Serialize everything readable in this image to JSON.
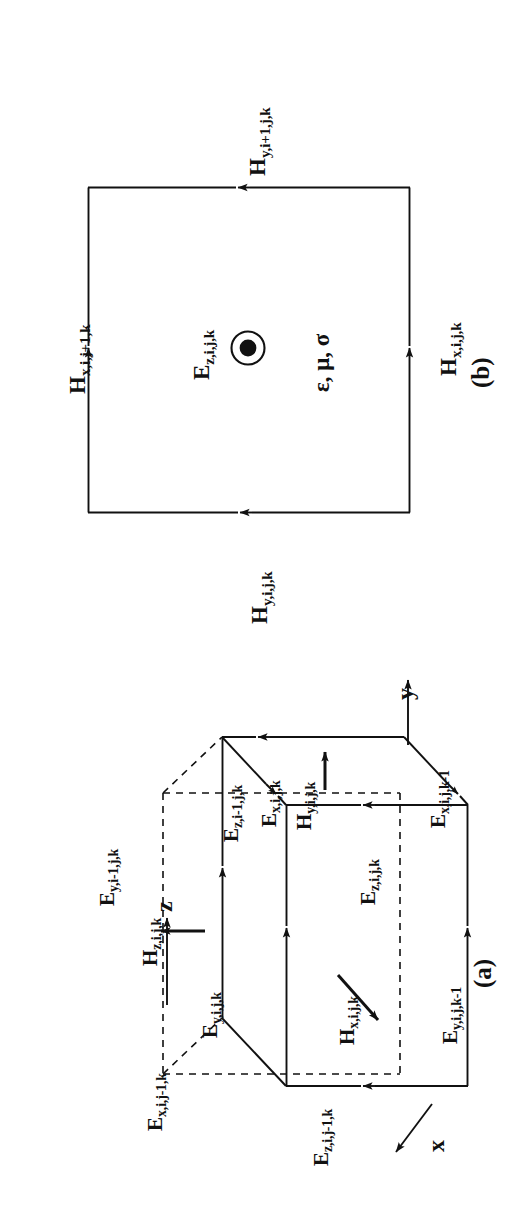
{
  "figure": {
    "kind": "yee-cell-fdtd-diagram",
    "orientation": "page rotated 90 degrees counter-clockwise",
    "background": "#ffffff",
    "ink": "#111111"
  },
  "panel_a": {
    "tag": "(a)",
    "description": "Three-dimensional Yee unit cell showing electric and magnetic field component locations",
    "axes": [
      {
        "name": "z-axis",
        "label": "z",
        "direction": "up"
      },
      {
        "name": "y-axis",
        "label": "y",
        "direction": "right"
      },
      {
        "name": "x-axis",
        "label": "x",
        "direction": "toward viewer, down-left"
      }
    ],
    "e_fields": [
      {
        "id": "ex_ijk",
        "base": "E",
        "sub": "x,i,j,k",
        "text": "Ex,i,j,k"
      },
      {
        "id": "ex_ijk1",
        "base": "E",
        "sub": "x,i,j,k-1",
        "text": "Ex,i,j,k-1"
      },
      {
        "id": "ex_ij1k",
        "base": "E",
        "sub": "x,i,j-1,k",
        "text": "Ex,i,j-1,k"
      },
      {
        "id": "ey_i1jk",
        "base": "E",
        "sub": "y,i-1,j,k",
        "text": "Ey,i-1,j,k"
      },
      {
        "id": "ey_ijk",
        "base": "E",
        "sub": "y,i,j,k",
        "text": "Ey,i,j,k"
      },
      {
        "id": "ey_ijk1",
        "base": "E",
        "sub": "y,i,j,k-1",
        "text": "Ey,i,j,k-1"
      },
      {
        "id": "ez_i1jk",
        "base": "E",
        "sub": "z,i-1,j,k",
        "text": "Ez,i-1,j,k"
      },
      {
        "id": "ez_ijk",
        "base": "E",
        "sub": "z,i,j,k",
        "text": "Ez,i,j,k"
      },
      {
        "id": "ez_ij1k",
        "base": "E",
        "sub": "z,i,j-1,k",
        "text": "Ez,i,j-1,k"
      }
    ],
    "h_fields": [
      {
        "id": "hx_ijk",
        "base": "H",
        "sub": "x,i,j,k",
        "text": "Hx,i,j,k"
      },
      {
        "id": "hy_ijk",
        "base": "H",
        "sub": "y,i,j,k",
        "text": "Hy,i,j,k"
      },
      {
        "id": "hz_ijk",
        "base": "H",
        "sub": "z,i,j,k",
        "text": "Hz,i,j,k"
      }
    ]
  },
  "panel_b": {
    "tag": "(b)",
    "description": "Two-dimensional contour around Ez showing the four surrounding H components",
    "center": {
      "field_label_base": "E",
      "field_label_sub": "z,i,j,k",
      "field_label_text": "Ez,i,j,k",
      "symbol": "circle-dot (vector out of page)",
      "material_properties": "ε, μ, σ"
    },
    "edges": [
      {
        "id": "top",
        "base": "H",
        "sub": "y,i+1,j,k",
        "text": "Hy,i+1,j,k",
        "arrow": "left"
      },
      {
        "id": "left",
        "base": "H",
        "sub": "x,i,j+1,k",
        "text": "Hx,i,j+1,k",
        "arrow": "up"
      },
      {
        "id": "right",
        "base": "H",
        "sub": "x,i,j,k",
        "text": "Hx,i,j,k",
        "arrow": "up"
      },
      {
        "id": "bottom",
        "base": "H",
        "sub": "y,i,j,k",
        "text": "Hy,i,j,k",
        "arrow": "left"
      }
    ]
  }
}
